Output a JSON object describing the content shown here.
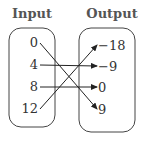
{
  "headers": {
    "input": "Input",
    "output": "Output"
  },
  "inputs": [
    "0",
    "4",
    "8",
    "12"
  ],
  "outputs": [
    "−18",
    "−9",
    "0",
    "9"
  ],
  "mapping": [
    {
      "from": 0,
      "to": 3
    },
    {
      "from": 1,
      "to": 1
    },
    {
      "from": 2,
      "to": 2
    },
    {
      "from": 3,
      "to": 0
    }
  ]
}
